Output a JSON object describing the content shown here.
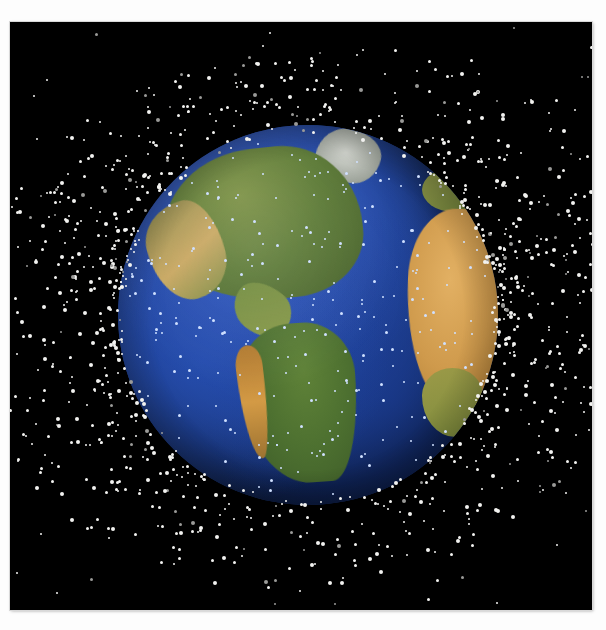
{
  "image": {
    "kind": "space-debris-visualization",
    "subject": "Earth surrounded by orbital debris cloud",
    "background_color": "#000000",
    "page_color": "#ffffff",
    "frame": {
      "left": 10,
      "top": 22,
      "width": 582,
      "height": 588
    }
  },
  "earth": {
    "center_x": 307,
    "center_y": 315,
    "radius": 190,
    "ocean_color": "#24479f",
    "land_green": "#5c7a36",
    "land_tan": "#cf9a4c",
    "ice_color": "#d6d9d2",
    "visible_landmasses": [
      "North America",
      "Greenland",
      "Central America",
      "South America",
      "Africa",
      "Europe"
    ]
  },
  "debris": {
    "dot_color": "#f2f2f0",
    "dot_color_over_earth": "#cfe0ff",
    "ring_description": "dense torus of low-earth-orbit debris plus sparse scattered outer objects",
    "leo_ring_count": 1400,
    "over_earth_count": 260,
    "scattered_count": 120
  }
}
